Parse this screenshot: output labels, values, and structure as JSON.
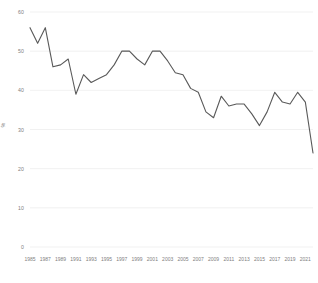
{
  "chart_data": {
    "type": "line",
    "title": "",
    "subtitle": "",
    "xlabel": "",
    "ylabel": "%",
    "xlim": [
      1985,
      2022
    ],
    "ylim": [
      0,
      60
    ],
    "grid": true,
    "legend": false,
    "legend_position": "none",
    "line_color": "#595959",
    "x": [
      1985,
      1986,
      1987,
      1988,
      1989,
      1990,
      1991,
      1992,
      1993,
      1994,
      1995,
      1996,
      1997,
      1998,
      1999,
      2000,
      2001,
      2002,
      2003,
      2004,
      2005,
      2006,
      2007,
      2008,
      2009,
      2010,
      2011,
      2012,
      2013,
      2014,
      2015,
      2016,
      2017,
      2018,
      2019,
      2020,
      2021,
      2022
    ],
    "x_tick_labels": [
      "1985",
      "1987",
      "1989",
      "1991",
      "1993",
      "1995",
      "1997",
      "1999",
      "2001",
      "2003",
      "2005",
      "2007",
      "2009",
      "2011",
      "2013",
      "2015",
      "2017",
      "2019",
      "2021"
    ],
    "y_tick_labels": [
      "0",
      "10",
      "20",
      "30",
      "40",
      "50",
      "60"
    ],
    "y_ticks": [
      0,
      10,
      20,
      30,
      40,
      50,
      60
    ],
    "series": [
      {
        "name": "",
        "values": [
          56.0,
          52.0,
          56.0,
          46.0,
          46.5,
          48.0,
          39.0,
          44.0,
          42.0,
          43.0,
          44.0,
          46.5,
          50.0,
          50.0,
          48.0,
          46.5,
          50.0,
          50.0,
          47.5,
          44.5,
          44.0,
          40.5,
          39.5,
          34.5,
          33.0,
          38.5,
          36.0,
          36.5,
          36.5,
          34.0,
          31.0,
          34.5,
          39.5,
          37.0,
          36.5,
          39.5,
          37.0,
          24.0
        ]
      }
    ]
  }
}
